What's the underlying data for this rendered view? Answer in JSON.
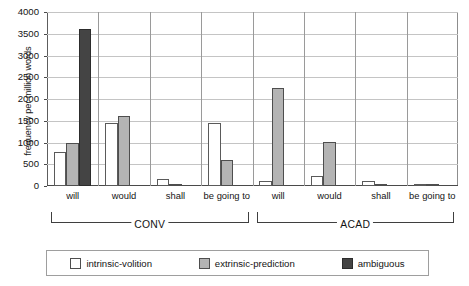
{
  "chart_data": {
    "type": "bar",
    "title": "",
    "xlabel": "",
    "ylabel": "frequency per million words",
    "ylim": [
      0,
      4000
    ],
    "ytick_labels": [
      "0",
      "500",
      "1000",
      "1500",
      "2000",
      "2500",
      "3000",
      "3500",
      "4000"
    ],
    "ytick_values": [
      0,
      500,
      1000,
      1500,
      2000,
      2500,
      3000,
      3500,
      4000
    ],
    "grid": true,
    "legend_position": "bottom",
    "categories": [
      "will",
      "would",
      "shall",
      "be going to",
      "will",
      "would",
      "shall",
      "be going to"
    ],
    "groups": [
      {
        "label": "CONV",
        "categories": [
          "will",
          "would",
          "shall",
          "be going to"
        ]
      },
      {
        "label": "ACAD",
        "categories": [
          "will",
          "would",
          "shall",
          "be going to"
        ]
      }
    ],
    "series": [
      {
        "name": "intrinsic-volition",
        "color": "#ffffff",
        "values": [
          790,
          1450,
          150,
          1450,
          120,
          220,
          110,
          15
        ]
      },
      {
        "name": "extrinsic-prediction",
        "color": "#b4b4b4",
        "values": [
          985,
          1600,
          30,
          600,
          2250,
          1010,
          55,
          20
        ]
      },
      {
        "name": "ambiguous",
        "color": "#444444",
        "values": [
          3620,
          0,
          0,
          0,
          0,
          0,
          0,
          0
        ]
      }
    ]
  }
}
